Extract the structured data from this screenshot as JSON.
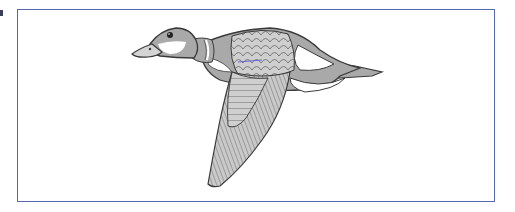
{
  "figure": {
    "frame_color": "#5668b3",
    "colors": {
      "body_gray": "#a9a9a9",
      "feather_light": "#cfcfcf",
      "outline": "#3a3a3a",
      "white_patch": "#ffffff",
      "accent_blue": "#6a6ad0"
    }
  }
}
